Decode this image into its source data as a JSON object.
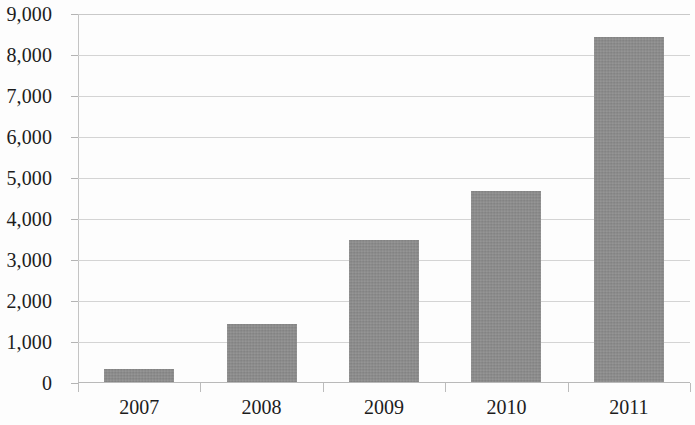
{
  "chart_data": {
    "type": "bar",
    "title": "",
    "subtitle": "",
    "xlabel": "",
    "ylabel": "",
    "categories": [
      "2007",
      "2008",
      "2009",
      "2010",
      "2011"
    ],
    "values": [
      340,
      1450,
      3500,
      4680,
      8430
    ],
    "series": [
      {
        "name": "",
        "values": [
          340,
          1450,
          3500,
          4680,
          8430
        ]
      }
    ],
    "ylim": [
      0,
      9000
    ],
    "ytick_step": 1000,
    "ytick_labels": [
      "9,000",
      "8,000",
      "7,000",
      "6,000",
      "5,000",
      "4,000",
      "3,000",
      "2,000",
      "1,000",
      "0"
    ],
    "ytick_values": [
      9000,
      8000,
      7000,
      6000,
      5000,
      4000,
      3000,
      2000,
      1000,
      0
    ],
    "grid": "horizontal",
    "legend": "none",
    "annotations": [],
    "bar_color": "#8a8a8a",
    "gridline_color": "#d4d4d4",
    "axis_color": "#b9b9b9",
    "background_color": "#fdfdfd",
    "text_color": "#1c1c1c"
  }
}
